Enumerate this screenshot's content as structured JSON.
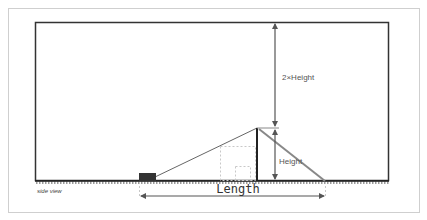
{
  "diagram": {
    "view_label": "side view",
    "labels": {
      "two_height": "2×Height",
      "height": "Height",
      "length": "Length"
    },
    "colors": {
      "frame_outer": "#cfcfcf",
      "frame_inner": "#333333",
      "ramp_line": "#666666",
      "diag_right": "#888888",
      "block": "#333333",
      "dotted": "#c8c8c8"
    }
  }
}
